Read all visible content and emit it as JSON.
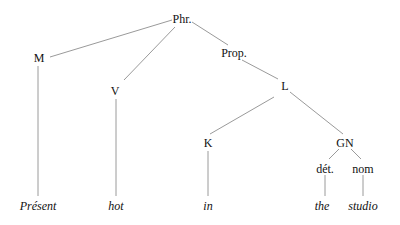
{
  "diagram": {
    "type": "syntax-tree",
    "line_color": "#9a9a9a",
    "text_color": "#111111",
    "nodes": [
      {
        "id": "phr",
        "label": "Phr.",
        "x": 182,
        "y": 13,
        "leaf": false
      },
      {
        "id": "m",
        "label": "M",
        "x": 39,
        "y": 52,
        "leaf": false
      },
      {
        "id": "v",
        "label": "V",
        "x": 115,
        "y": 85,
        "leaf": false
      },
      {
        "id": "prop",
        "label": "Prop.",
        "x": 234,
        "y": 47,
        "leaf": false
      },
      {
        "id": "l",
        "label": "L",
        "x": 285,
        "y": 80,
        "leaf": false
      },
      {
        "id": "k",
        "label": "K",
        "x": 208,
        "y": 137,
        "leaf": false
      },
      {
        "id": "gn",
        "label": "GN",
        "x": 345,
        "y": 137,
        "leaf": false
      },
      {
        "id": "det",
        "label": "dét.",
        "x": 325,
        "y": 163,
        "leaf": false
      },
      {
        "id": "nom",
        "label": "nom",
        "x": 363,
        "y": 163,
        "leaf": false
      },
      {
        "id": "present",
        "label": "Présent",
        "x": 38,
        "y": 200,
        "leaf": true
      },
      {
        "id": "hot",
        "label": "hot",
        "x": 116,
        "y": 200,
        "leaf": true
      },
      {
        "id": "in",
        "label": "in",
        "x": 208,
        "y": 200,
        "leaf": true
      },
      {
        "id": "the",
        "label": "the",
        "x": 322,
        "y": 200,
        "leaf": true
      },
      {
        "id": "studio",
        "label": "studio",
        "x": 363,
        "y": 200,
        "leaf": true
      }
    ],
    "edges": [
      {
        "from": "phr",
        "to": "m",
        "x1": 172,
        "y1": 20,
        "x2": 50,
        "y2": 57
      },
      {
        "from": "phr",
        "to": "v",
        "x1": 175,
        "y1": 27,
        "x2": 124,
        "y2": 80
      },
      {
        "from": "phr",
        "to": "prop",
        "x1": 192,
        "y1": 22,
        "x2": 228,
        "y2": 45
      },
      {
        "from": "m",
        "to": "present",
        "x1": 38,
        "y1": 66,
        "x2": 38,
        "y2": 196
      },
      {
        "from": "v",
        "to": "hot",
        "x1": 116,
        "y1": 99,
        "x2": 116,
        "y2": 196
      },
      {
        "from": "prop",
        "to": "l",
        "x1": 242,
        "y1": 60,
        "x2": 278,
        "y2": 79
      },
      {
        "from": "l",
        "to": "k",
        "x1": 274,
        "y1": 97,
        "x2": 210,
        "y2": 134
      },
      {
        "from": "l",
        "to": "gn",
        "x1": 290,
        "y1": 92,
        "x2": 343,
        "y2": 134
      },
      {
        "from": "k",
        "to": "in",
        "x1": 208,
        "y1": 151,
        "x2": 208,
        "y2": 196
      },
      {
        "from": "gn",
        "to": "det",
        "x1": 339,
        "y1": 149,
        "x2": 329,
        "y2": 159
      },
      {
        "from": "gn",
        "to": "nom",
        "x1": 351,
        "y1": 149,
        "x2": 361,
        "y2": 159
      },
      {
        "from": "det",
        "to": "the",
        "x1": 325,
        "y1": 175,
        "x2": 325,
        "y2": 196
      },
      {
        "from": "nom",
        "to": "studio",
        "x1": 363,
        "y1": 175,
        "x2": 363,
        "y2": 196
      }
    ]
  }
}
